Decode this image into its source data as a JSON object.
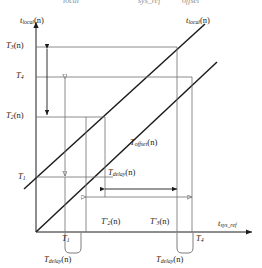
{
  "figure": {
    "type": "timing-diagram",
    "axes": {
      "y_axis_label": "t",
      "y_axis_sub": "local",
      "y_axis_arg": "(n)",
      "x_axis_label": "t",
      "x_axis_sub": "sys_ref",
      "origin_marker": ""
    },
    "curve_label": {
      "main": "t",
      "sub": "local",
      "arg": "(n)"
    },
    "y_ticks": [
      {
        "id": "T3n",
        "base": "T",
        "sub": "3",
        "arg": "(n)",
        "y": 47
      },
      {
        "id": "T4",
        "base": "T",
        "sub": "4",
        "arg": "",
        "y": 77
      },
      {
        "id": "T2n",
        "base": "T",
        "sub": "2",
        "arg": "(n)",
        "y": 117
      },
      {
        "id": "T1",
        "base": "T",
        "sub": "1",
        "arg": "",
        "y": 177
      }
    ],
    "x_ticks": [
      {
        "id": "T1b",
        "base": "T",
        "sub": "1",
        "arg": "",
        "x": 65
      },
      {
        "id": "T4b",
        "base": "T",
        "sub": "4",
        "arg": "",
        "x": 192
      }
    ],
    "interval_labels": [
      {
        "id": "Toffset",
        "base": "T",
        "sub": "offset",
        "arg": "(n)",
        "x": 138,
        "y": 143
      },
      {
        "id": "Tdelay_mid",
        "base": "T",
        "sub": "delay",
        "arg": "(n)",
        "x": 108,
        "y": 173
      },
      {
        "id": "T2prime",
        "base": "T",
        "sub": "2",
        "prime": "'",
        "arg": "(n)",
        "x": 103,
        "y": 222
      },
      {
        "id": "T3prime",
        "base": "T",
        "sub": "3",
        "prime": "'",
        "arg": "(n)",
        "x": 150,
        "y": 222
      },
      {
        "id": "Tdelay_left",
        "base": "T",
        "sub": "delay",
        "arg": "(n)",
        "x": 46,
        "y": 257
      },
      {
        "id": "Tdelay_right",
        "base": "T",
        "sub": "delay",
        "arg": "(n)",
        "x": 162,
        "y": 257
      }
    ],
    "top_fragments": [
      {
        "text": "local",
        "x": 63
      },
      {
        "text": "sys_ref",
        "x": 138
      },
      {
        "text": "offset",
        "x": 182
      }
    ],
    "colors": {
      "line": "#1c1c1c",
      "gray_line": "#7a7a7a",
      "background": "#ffffff",
      "text": "#1c1c1c"
    }
  }
}
